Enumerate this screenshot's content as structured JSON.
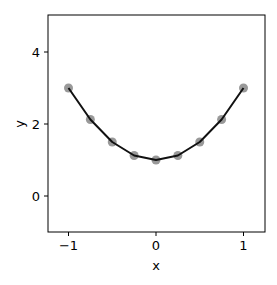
{
  "chart_data": {
    "type": "line",
    "title": "",
    "xlabel": "x",
    "ylabel": "y",
    "xlim": [
      -1.25,
      1.25
    ],
    "ylim": [
      -1.0,
      5.0
    ],
    "xticks": [
      -1,
      0,
      1
    ],
    "xtick_labels": [
      "−1",
      "0",
      "1"
    ],
    "yticks": [
      0,
      2,
      4
    ],
    "ytick_labels": [
      "0",
      "2",
      "4"
    ],
    "grid": false,
    "legend": null,
    "series": [
      {
        "name": "y = 1 + 2x²",
        "x": [
          -1,
          -0.75,
          -0.5,
          -0.25,
          0,
          0.25,
          0.5,
          0.75,
          1
        ],
        "values": [
          3.0,
          2.125,
          1.5,
          1.125,
          1.0,
          1.125,
          1.5,
          2.125,
          3.0
        ],
        "line_color": "#111111",
        "marker_color": "#7f7f7f",
        "marker": "circle"
      }
    ]
  },
  "axes": {
    "xlabel": "x",
    "ylabel": "y"
  }
}
